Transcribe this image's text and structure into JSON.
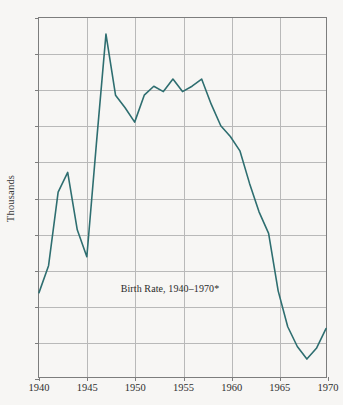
{
  "chart_data": {
    "type": "line",
    "title": "",
    "annotation": "Birth Rate, 1940–1970*",
    "xlabel": "",
    "ylabel": "Thousands",
    "xlim": [
      1940,
      1970
    ],
    "ylim": [
      17,
      27
    ],
    "grid": true,
    "legend": false,
    "line_color": "#2e6e70",
    "xticks": [
      "1940",
      "1945",
      "1950",
      "1955",
      "1960",
      "1965",
      "1970"
    ],
    "yticks": [
      "17",
      "18",
      "19",
      "20",
      "21",
      "22",
      "23",
      "24",
      "25",
      "26",
      "27"
    ],
    "x": [
      1940,
      1941,
      1942,
      1943,
      1944,
      1945,
      1946,
      1947,
      1948,
      1949,
      1950,
      1951,
      1952,
      1953,
      1954,
      1955,
      1956,
      1957,
      1958,
      1959,
      1960,
      1961,
      1962,
      1963,
      1964,
      1965,
      1966,
      1967,
      1968,
      1969,
      1970
    ],
    "values": [
      19.35,
      20.1,
      22.15,
      22.7,
      21.1,
      20.35,
      23.5,
      26.55,
      24.85,
      24.5,
      24.1,
      24.85,
      25.1,
      24.95,
      25.3,
      24.95,
      25.1,
      25.3,
      24.6,
      24.0,
      23.7,
      23.3,
      22.4,
      21.6,
      21.0,
      19.4,
      18.4,
      17.85,
      17.5,
      17.8,
      18.35
    ],
    "series_name": "Birth Rate",
    "annotation_x": 1953.6,
    "annotation_y": 19.52
  }
}
